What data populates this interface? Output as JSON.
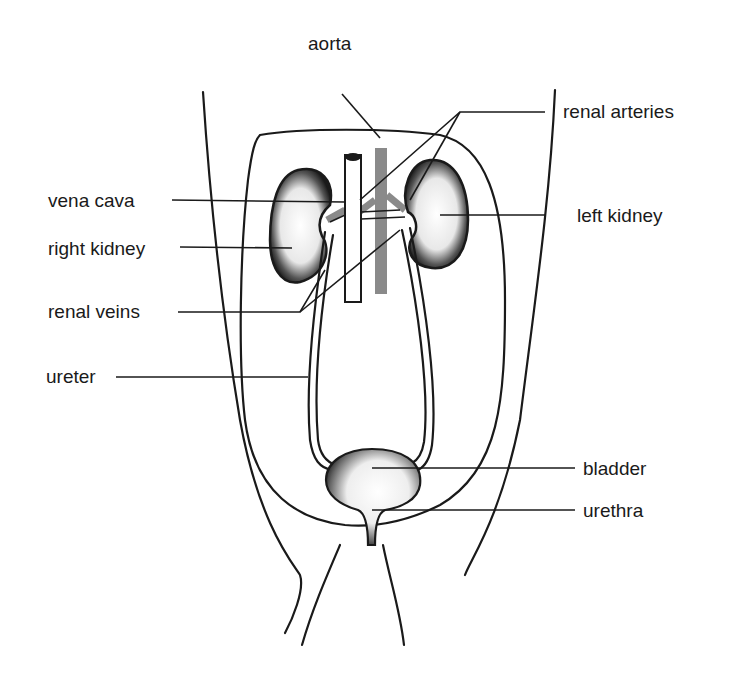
{
  "diagram": {
    "labels": {
      "aorta": "aorta",
      "renal_arteries": "renal arteries",
      "vena_cava": "vena cava",
      "left_kidney": "left kidney",
      "right_kidney": "right kidney",
      "renal_veins": "renal veins",
      "ureter": "ureter",
      "bladder": "bladder",
      "urethra": "urethra"
    },
    "colors": {
      "ink": "#1a1a1a",
      "aorta": "#8a8a8a",
      "background": "#ffffff"
    }
  }
}
